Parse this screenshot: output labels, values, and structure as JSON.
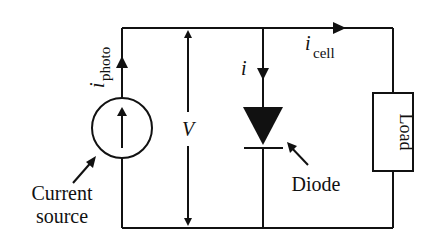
{
  "diagram": {
    "components": {
      "current_source": {
        "label_line1": "Current",
        "label_line2": "source"
      },
      "diode": {
        "label": "Diode"
      },
      "load": {
        "label": "Load"
      }
    },
    "currents": {
      "photo": {
        "symbol": "i",
        "subscript": "photo"
      },
      "diode": {
        "symbol": "i"
      },
      "cell": {
        "symbol": "i",
        "subscript": "cell"
      }
    },
    "voltage": {
      "symbol": "V"
    },
    "colors": {
      "stroke": "#111111",
      "background": "#ffffff"
    }
  }
}
